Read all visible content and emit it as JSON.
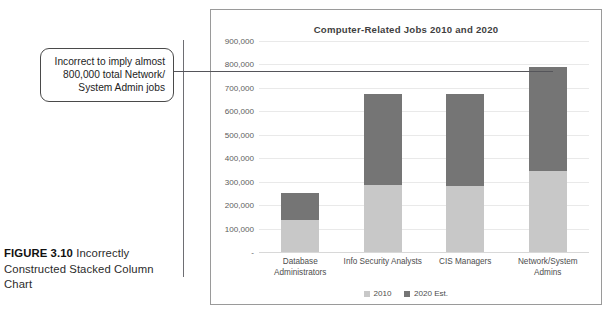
{
  "caption": {
    "figure_number": "FIGURE 3.10",
    "text": " Incorrectly Constructed Stacked Column Chart"
  },
  "annotation": {
    "text": "Incorrect to imply almost 800,000 total Network/ System Admin jobs",
    "leader_value": 790000
  },
  "colors": {
    "series_2010": "#c8c8c8",
    "series_2020": "#757575",
    "gridline": "#e9e9e9",
    "frame_border": "#9a9a9a",
    "leader_line": "#55555a",
    "title_text": "#3f3f3f",
    "tick_text": "#5c5c5c"
  },
  "chart_data": {
    "type": "bar",
    "subtype": "stacked-column",
    "title": "Computer-Related Jobs 2010 and 2020",
    "xlabel": "",
    "ylabel": "",
    "ylim": [
      0,
      900000
    ],
    "ytick_step": 100000,
    "ytick_labels": [
      "900,000",
      "800,000",
      "700,000",
      "600,000",
      "500,000",
      "400,000",
      "300,000",
      "200,000",
      "100,000",
      "-"
    ],
    "ytick_values": [
      900000,
      800000,
      700000,
      600000,
      500000,
      400000,
      300000,
      200000,
      100000,
      0
    ],
    "grid": true,
    "legend_position": "bottom",
    "categories": [
      "Database Administrators",
      "Info Security Analysts",
      "CIS Managers",
      "Network/System Admins"
    ],
    "series": [
      {
        "name": "2010",
        "color": "#c8c8c8",
        "values": [
          135000,
          285000,
          280000,
          347000
        ]
      },
      {
        "name": "2020 Est.",
        "color": "#757575",
        "values": [
          115000,
          390000,
          395000,
          443000
        ]
      }
    ],
    "stacked_totals": [
      250000,
      675000,
      675000,
      790000
    ],
    "legend": [
      "2010",
      "2020 Est."
    ]
  }
}
